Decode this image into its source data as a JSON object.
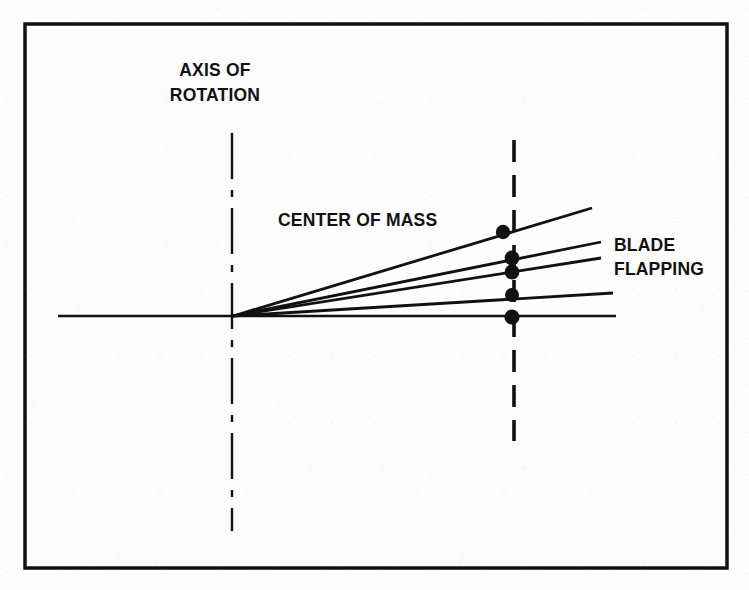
{
  "figure": {
    "title": "Blade Flapping",
    "background_color": "#fdfdfd",
    "ink_color": "#111111",
    "border": {
      "x": 25,
      "y": 24,
      "width": 702,
      "height": 544,
      "stroke_width": 3.5
    }
  },
  "labels": {
    "axis_of_rotation": {
      "line1": "AXIS OF",
      "line2": "ROTATION",
      "x": 215,
      "y1": 76,
      "y2": 101,
      "anchor": "middle"
    },
    "center_of_mass": {
      "text": "CENTER OF MASS",
      "x": 278,
      "y": 226,
      "anchor": "start"
    },
    "blade_flapping": {
      "line1": "BLADE",
      "line2": "FLAPPING",
      "x": 614,
      "y1": 251,
      "y2": 275,
      "anchor": "start"
    }
  },
  "chart_data": {
    "type": "line",
    "title": "Blade Flapping",
    "xlabel": "",
    "ylabel": "",
    "hub": {
      "x": 233,
      "y": 316
    },
    "rotation_axis": {
      "name": "axis-of-rotation",
      "x": 232,
      "y_top": 133,
      "y_bottom": 531,
      "style": "dash-dot",
      "stroke_width": 2.4
    },
    "radial_station": {
      "name": "center-of-mass-station",
      "x": 514,
      "y_top": 140,
      "y_bottom": 441,
      "style": "dashed",
      "stroke_width": 3.6
    },
    "baseline": {
      "name": "plane-of-rotation",
      "x1": 58,
      "x2": 616,
      "y": 316,
      "stroke_width": 2.6
    },
    "blades": [
      {
        "name": "blade-flap-4",
        "x1": 233,
        "y1": 316,
        "x2": 592,
        "y2": 208,
        "stroke_width": 2.8,
        "flap_angle_deg": 16.7
      },
      {
        "name": "blade-flap-3",
        "x1": 233,
        "y1": 316,
        "x2": 601,
        "y2": 242,
        "stroke_width": 2.8,
        "flap_angle_deg": 11.3
      },
      {
        "name": "blade-flap-2",
        "x1": 233,
        "y1": 316,
        "x2": 601,
        "y2": 258,
        "stroke_width": 2.8,
        "flap_angle_deg": 8.9
      },
      {
        "name": "blade-flap-1",
        "x1": 233,
        "y1": 316,
        "x2": 613,
        "y2": 293,
        "stroke_width": 2.8,
        "flap_angle_deg": 3.5
      },
      {
        "name": "blade-flap-0",
        "x1": 233,
        "y1": 316,
        "x2": 616,
        "y2": 316,
        "stroke_width": 2.6,
        "flap_angle_deg": 0.0
      }
    ],
    "center_of_mass_points": [
      {
        "name": "com-marker-4",
        "x": 503,
        "y": 232,
        "r": 7.2
      },
      {
        "name": "com-marker-3",
        "x": 512,
        "y": 258,
        "r": 7.4
      },
      {
        "name": "com-marker-2",
        "x": 512,
        "y": 272,
        "r": 7.4
      },
      {
        "name": "com-marker-1",
        "x": 512,
        "y": 295,
        "r": 7.0
      },
      {
        "name": "com-marker-0",
        "x": 512,
        "y": 317,
        "r": 7.6
      }
    ]
  }
}
